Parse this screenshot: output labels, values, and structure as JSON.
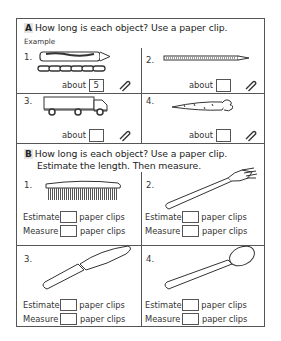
{
  "sectionA": {
    "letter": "A",
    "title": "How long is each object? Use a paper clip.",
    "example_label": "Example",
    "items": [
      {
        "num": "1.",
        "object": "crayon",
        "about_label": "about",
        "value": "5",
        "icon": "paper-clip-icon"
      },
      {
        "num": "2.",
        "object": "pencil",
        "about_label": "about",
        "value": "",
        "icon": "paper-clip-icon"
      },
      {
        "num": "3.",
        "object": "truck",
        "about_label": "about",
        "value": "",
        "icon": "paper-clip-icon"
      },
      {
        "num": "4.",
        "object": "carrot",
        "about_label": "about",
        "value": "",
        "icon": "paper-clip-icon"
      }
    ]
  },
  "sectionB": {
    "letter": "B",
    "title_line1": "How long is each object? Use a paper clip.",
    "title_line2": "Estimate the length. Then measure.",
    "estimate_label": "Estimate",
    "measure_label": "Measure",
    "unit_label": "paper clips",
    "items": [
      {
        "num": "1.",
        "object": "comb",
        "estimate": "",
        "measure": ""
      },
      {
        "num": "2.",
        "object": "fork",
        "estimate": "",
        "measure": ""
      },
      {
        "num": "3.",
        "object": "knife",
        "estimate": "",
        "measure": ""
      },
      {
        "num": "4.",
        "object": "spoon",
        "estimate": "",
        "measure": ""
      }
    ]
  }
}
